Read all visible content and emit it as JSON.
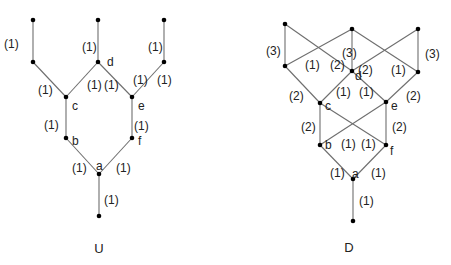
{
  "diagrams": [
    {
      "caption": "U",
      "caption_pos": [
        99,
        253
      ],
      "nodes": [
        {
          "id": "t1",
          "x": 33,
          "y": 20,
          "label": ""
        },
        {
          "id": "t2",
          "x": 98,
          "y": 20,
          "label": ""
        },
        {
          "id": "t3",
          "x": 164,
          "y": 20,
          "label": ""
        },
        {
          "id": "m1",
          "x": 33,
          "y": 62,
          "label": ""
        },
        {
          "id": "d",
          "x": 98,
          "y": 62,
          "label": "d"
        },
        {
          "id": "m3",
          "x": 164,
          "y": 62,
          "label": ""
        },
        {
          "id": "c",
          "x": 66,
          "y": 97,
          "label": "c"
        },
        {
          "id": "e",
          "x": 132,
          "y": 97,
          "label": "e"
        },
        {
          "id": "b",
          "x": 66,
          "y": 138,
          "label": "b"
        },
        {
          "id": "f",
          "x": 132,
          "y": 138,
          "label": "f"
        },
        {
          "id": "a",
          "x": 99,
          "y": 174,
          "label": "a"
        },
        {
          "id": "r",
          "x": 99,
          "y": 216,
          "label": ""
        }
      ],
      "node_labels": [
        {
          "text": "d",
          "x": 107,
          "y": 66
        },
        {
          "text": "c",
          "x": 72,
          "y": 110
        },
        {
          "text": "e",
          "x": 138,
          "y": 110
        },
        {
          "text": "b",
          "x": 72,
          "y": 145
        },
        {
          "text": "f",
          "x": 138,
          "y": 145
        },
        {
          "text": "a",
          "x": 96,
          "y": 170
        }
      ],
      "edges": [
        {
          "from": "t1",
          "to": "m1"
        },
        {
          "from": "t2",
          "to": "d"
        },
        {
          "from": "t3",
          "to": "m3"
        },
        {
          "from": "m1",
          "to": "c"
        },
        {
          "from": "d",
          "to": "c"
        },
        {
          "from": "d",
          "to": "e"
        },
        {
          "from": "m3",
          "to": "e"
        },
        {
          "from": "c",
          "to": "b"
        },
        {
          "from": "e",
          "to": "f"
        },
        {
          "from": "b",
          "to": "a"
        },
        {
          "from": "f",
          "to": "a"
        },
        {
          "from": "a",
          "to": "r"
        }
      ],
      "weight_labels": [
        {
          "text": "(1)",
          "x": 4,
          "y": 48
        },
        {
          "text": "(1)",
          "x": 82,
          "y": 51
        },
        {
          "text": "(1)",
          "x": 148,
          "y": 51
        },
        {
          "text": "(1)",
          "x": 38,
          "y": 94
        },
        {
          "text": "(1)",
          "x": 87,
          "y": 89
        },
        {
          "text": "(1)",
          "x": 104,
          "y": 89
        },
        {
          "text": "(1)",
          "x": 133,
          "y": 84
        },
        {
          "text": "(1)",
          "x": 157,
          "y": 84
        },
        {
          "text": "(1)",
          "x": 44,
          "y": 129
        },
        {
          "text": "(1)",
          "x": 134,
          "y": 130
        },
        {
          "text": "(1)",
          "x": 72,
          "y": 172
        },
        {
          "text": "(1)",
          "x": 116,
          "y": 172
        },
        {
          "text": "(1)",
          "x": 104,
          "y": 204
        }
      ]
    },
    {
      "caption": "D",
      "caption_pos": [
        349,
        252
      ],
      "nodes": [
        {
          "id": "tl",
          "x": 285,
          "y": 24,
          "label": ""
        },
        {
          "id": "tm",
          "x": 352,
          "y": 29,
          "label": ""
        },
        {
          "id": "tr",
          "x": 418,
          "y": 29,
          "label": ""
        },
        {
          "id": "ml",
          "x": 285,
          "y": 66,
          "label": ""
        },
        {
          "id": "d",
          "x": 352,
          "y": 71,
          "label": "d"
        },
        {
          "id": "mr",
          "x": 418,
          "y": 72,
          "label": ""
        },
        {
          "id": "c",
          "x": 320,
          "y": 103,
          "label": "c"
        },
        {
          "id": "e",
          "x": 386,
          "y": 102,
          "label": "e"
        },
        {
          "id": "b",
          "x": 320,
          "y": 145,
          "label": "b"
        },
        {
          "id": "f",
          "x": 386,
          "y": 145,
          "label": "f"
        },
        {
          "id": "a",
          "x": 353,
          "y": 179,
          "label": "a"
        },
        {
          "id": "r",
          "x": 353,
          "y": 221,
          "label": ""
        }
      ],
      "node_labels": [
        {
          "text": "d",
          "x": 355,
          "y": 80
        },
        {
          "text": "c",
          "x": 325,
          "y": 110
        },
        {
          "text": "e",
          "x": 391,
          "y": 110
        },
        {
          "text": "b",
          "x": 325,
          "y": 149
        },
        {
          "text": "f",
          "x": 390,
          "y": 155
        },
        {
          "text": "a",
          "x": 352,
          "y": 178
        }
      ],
      "edges": [
        {
          "from": "tl",
          "to": "ml"
        },
        {
          "from": "tl",
          "to": "d"
        },
        {
          "from": "ml",
          "to": "tm"
        },
        {
          "from": "tm",
          "to": "d"
        },
        {
          "from": "tm",
          "to": "mr"
        },
        {
          "from": "d",
          "to": "tr"
        },
        {
          "from": "tr",
          "to": "mr"
        },
        {
          "from": "ml",
          "to": "c"
        },
        {
          "from": "d",
          "to": "c"
        },
        {
          "from": "d",
          "to": "e"
        },
        {
          "from": "mr",
          "to": "e"
        },
        {
          "from": "c",
          "to": "b"
        },
        {
          "from": "c",
          "to": "f"
        },
        {
          "from": "e",
          "to": "b"
        },
        {
          "from": "e",
          "to": "f"
        },
        {
          "from": "b",
          "to": "a"
        },
        {
          "from": "f",
          "to": "a"
        },
        {
          "from": "a",
          "to": "r"
        }
      ],
      "weight_labels": [
        {
          "text": "(3)",
          "x": 266,
          "y": 55
        },
        {
          "text": "(1)",
          "x": 305,
          "y": 69
        },
        {
          "text": "(2)",
          "x": 330,
          "y": 69
        },
        {
          "text": "(3)",
          "x": 342,
          "y": 57
        },
        {
          "text": "(2)",
          "x": 358,
          "y": 74
        },
        {
          "text": "(1)",
          "x": 391,
          "y": 74
        },
        {
          "text": "(3)",
          "x": 425,
          "y": 58
        },
        {
          "text": "(2)",
          "x": 289,
          "y": 100
        },
        {
          "text": "(1)",
          "x": 336,
          "y": 96
        },
        {
          "text": "(1)",
          "x": 359,
          "y": 96
        },
        {
          "text": "(2)",
          "x": 406,
          "y": 100
        },
        {
          "text": "(2)",
          "x": 301,
          "y": 131
        },
        {
          "text": "(2)",
          "x": 392,
          "y": 131
        },
        {
          "text": "(1)",
          "x": 341,
          "y": 148
        },
        {
          "text": "(1)",
          "x": 361,
          "y": 148
        },
        {
          "text": "(1)",
          "x": 330,
          "y": 177
        },
        {
          "text": "(1)",
          "x": 371,
          "y": 177
        },
        {
          "text": "(1)",
          "x": 359,
          "y": 205
        }
      ]
    }
  ]
}
